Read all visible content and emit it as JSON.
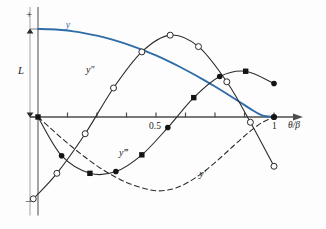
{
  "figure": {
    "name": "beam-deflection-derivatives-plot",
    "background": "#fdfdfd",
    "axis_color": "#4d4d4d",
    "curve_color_y": "#2f6ca8",
    "curve_color_derivatives": "#2a2a2a"
  },
  "labels": {
    "plus_sign": "+",
    "minus_sign": "−",
    "amplitude": "L",
    "x_axis_title": "θ/β",
    "tick_mid": "0.5",
    "tick_end": "1",
    "curve_y": "y",
    "curve_y_prime": "y′",
    "curve_y_double_prime": "y″",
    "curve_y_triple_prime": "y‴"
  },
  "chart_data": {
    "type": "line",
    "title": "",
    "xlabel": "θ/β",
    "ylabel": "",
    "xlim": [
      0,
      1.12
    ],
    "ylim": [
      -1.15,
      1.25
    ],
    "grid": false,
    "legend": "inline-curve-labels",
    "x_ticks": [
      0,
      0.125,
      0.25,
      0.375,
      0.5,
      0.625,
      0.75,
      0.875,
      1.0
    ],
    "x_tick_labels": [
      "",
      "",
      "",
      "",
      "0.5",
      "",
      "",
      "",
      "1"
    ],
    "y_reference_marks": [
      "+",
      "L",
      "−"
    ],
    "series": [
      {
        "name": "y",
        "label": "y",
        "color": "#2f6ca8",
        "style": "solid",
        "width": 1.9,
        "markers": "none",
        "x": [
          0.0,
          0.05,
          0.1,
          0.15,
          0.2,
          0.25,
          0.3,
          0.35,
          0.4,
          0.45,
          0.5,
          0.55,
          0.6,
          0.65,
          0.7,
          0.75,
          0.8,
          0.85,
          0.9,
          0.95,
          1.0
        ],
        "y": [
          1.0,
          0.997,
          0.988,
          0.973,
          0.951,
          0.924,
          0.891,
          0.851,
          0.806,
          0.755,
          0.699,
          0.637,
          0.571,
          0.5,
          0.425,
          0.346,
          0.264,
          0.179,
          0.092,
          0.018,
          0.0
        ]
      },
      {
        "name": "y'",
        "label": "y′",
        "color": "#2a2a2a",
        "style": "dashed",
        "width": 1.1,
        "markers": "none",
        "x": [
          0.0,
          0.05,
          0.1,
          0.15,
          0.2,
          0.25,
          0.3,
          0.35,
          0.4,
          0.45,
          0.5,
          0.55,
          0.6,
          0.65,
          0.7,
          0.75,
          0.8,
          0.85,
          0.9,
          0.95,
          1.0
        ],
        "y": [
          0.0,
          -0.12,
          -0.24,
          -0.352,
          -0.458,
          -0.555,
          -0.64,
          -0.712,
          -0.77,
          -0.812,
          -0.838,
          -0.83,
          -0.79,
          -0.72,
          -0.628,
          -0.518,
          -0.398,
          -0.276,
          -0.16,
          -0.062,
          0.0
        ]
      },
      {
        "name": "y''",
        "label": "y″",
        "color": "#2a2a2a",
        "style": "solid",
        "width": 1.1,
        "markers": "open-circle",
        "x": [
          -0.02,
          0.08,
          0.2,
          0.32,
          0.44,
          0.56,
          0.68,
          0.8,
          0.9,
          1.0
        ],
        "y": [
          -0.93,
          -0.64,
          -0.19,
          0.33,
          0.74,
          0.93,
          0.8,
          0.4,
          -0.06,
          -0.56
        ]
      },
      {
        "name": "y'''",
        "label": "y‴",
        "color": "#2a2a2a",
        "style": "solid",
        "width": 1.1,
        "markers": "filled",
        "x": [
          0.0,
          0.1,
          0.22,
          0.33,
          0.44,
          0.55,
          0.66,
          0.77,
          0.88,
          1.0
        ],
        "y": [
          0.0,
          -0.44,
          -0.64,
          -0.62,
          -0.43,
          -0.12,
          0.22,
          0.46,
          0.52,
          0.38
        ]
      }
    ],
    "annotations": [
      {
        "text": "y",
        "x": 0.13,
        "y": 1.05,
        "color": "#2f6ca8"
      },
      {
        "text": "y″",
        "x": 0.22,
        "y": 0.52,
        "color": "#2a2a2a"
      },
      {
        "text": "y‴",
        "x": 0.36,
        "y": -0.42,
        "color": "#2a2a2a"
      },
      {
        "text": "y′",
        "x": 0.7,
        "y": -0.66,
        "color": "#2a2a2a"
      }
    ]
  }
}
